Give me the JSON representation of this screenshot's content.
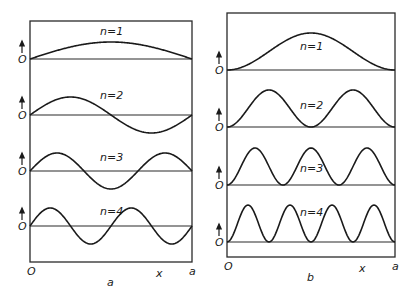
{
  "figure": {
    "panels": [
      {
        "id": "a",
        "caption": "a",
        "description": "Wavefunctions psi_n(x) of particle in a 1D box",
        "x_start_label": "O",
        "x_var_label": "x",
        "x_end_label": "a",
        "frame": {
          "x0": 30,
          "x1": 192,
          "y0": 21,
          "y1": 262
        },
        "rows": [
          {
            "label": "n=1",
            "n": 1,
            "baseline": 59,
            "amp": 17,
            "zero_label": "O",
            "label_x": 100,
            "label_y": 35
          },
          {
            "label": "n=2",
            "n": 2,
            "baseline": 115,
            "amp": 18,
            "zero_label": "O",
            "label_x": 100,
            "label_y": 99
          },
          {
            "label": "n=3",
            "n": 3,
            "baseline": 171,
            "amp": 18,
            "zero_label": "O",
            "label_x": 100,
            "label_y": 161
          },
          {
            "label": "n=4",
            "n": 4,
            "baseline": 226,
            "amp": 18,
            "zero_label": "O",
            "label_x": 100,
            "label_y": 215
          }
        ]
      },
      {
        "id": "b",
        "caption": "b",
        "description": "Probability densities psi_n^2(x) of particle in a 1D box",
        "x_start_label": "O",
        "x_var_label": "x",
        "x_end_label": "a",
        "frame": {
          "x0": 227,
          "x1": 395,
          "y0": 13,
          "y1": 257
        },
        "rows": [
          {
            "label": "n=1",
            "n": 1,
            "baseline": 70,
            "amp": 37,
            "zero_label": "O",
            "label_x": 300,
            "label_y": 50
          },
          {
            "label": "n=2",
            "n": 2,
            "baseline": 127,
            "amp": 37,
            "zero_label": "O",
            "label_x": 300,
            "label_y": 109
          },
          {
            "label": "n=3",
            "n": 3,
            "baseline": 185,
            "amp": 37,
            "zero_label": "O",
            "label_x": 300,
            "label_y": 172
          },
          {
            "label": "n=4",
            "n": 4,
            "baseline": 242,
            "amp": 37,
            "zero_label": "O",
            "label_x": 300,
            "label_y": 216
          }
        ]
      }
    ]
  }
}
